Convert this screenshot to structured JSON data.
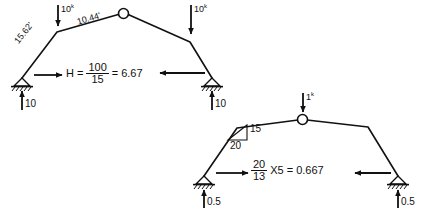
{
  "figure": {
    "stroke_color": "#111111",
    "background": "#ffffff"
  },
  "top_frame": {
    "name": "three-hinged-frame-actual-load",
    "loads": [
      {
        "id": "left-load",
        "label": "10",
        "unit": "k",
        "direction": "down"
      },
      {
        "id": "right-load",
        "label": "10",
        "unit": "k",
        "direction": "down"
      }
    ],
    "member_labels": [
      {
        "id": "left-member-length",
        "text": "15.62'"
      },
      {
        "id": "top-member-length",
        "text": "10.44'"
      }
    ],
    "equation": {
      "lhs": "H",
      "equals1": "=",
      "numerator": "100",
      "denominator": "15",
      "equals2": "=",
      "result": "6.67"
    },
    "reactions": [
      {
        "id": "left-vertical-reaction",
        "label": "10",
        "direction": "up"
      },
      {
        "id": "right-vertical-reaction",
        "label": "10",
        "direction": "up"
      },
      {
        "id": "left-horizontal-reaction",
        "direction": "right"
      },
      {
        "id": "right-horizontal-reaction",
        "direction": "left"
      }
    ]
  },
  "bottom_frame": {
    "name": "three-hinged-frame-unit-load",
    "loads": [
      {
        "id": "apex-unit-load",
        "label": "1",
        "unit": "k",
        "direction": "down"
      }
    ],
    "slope_triangle": {
      "rise": "15",
      "run": "20"
    },
    "equation": {
      "numerator": "20",
      "denominator": "13",
      "multiplier": "X5",
      "equals": "=",
      "result": "0.667"
    },
    "reactions": [
      {
        "id": "left-vertical-reaction",
        "label": "0.5",
        "direction": "up"
      },
      {
        "id": "right-vertical-reaction",
        "label": "0.5",
        "direction": "up"
      },
      {
        "id": "left-horizontal-reaction",
        "direction": "right"
      },
      {
        "id": "right-horizontal-reaction",
        "direction": "left"
      }
    ]
  },
  "icons": {
    "hinge": "hinge-circle-icon",
    "pin_support": "pin-support-icon",
    "hatching": "ground-hatch-icon",
    "arrow": "force-arrow-icon"
  }
}
